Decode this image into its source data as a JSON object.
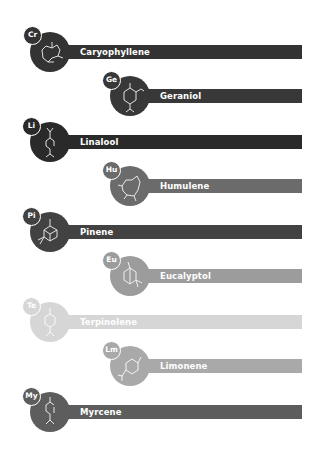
{
  "terpenes": [
    {
      "symbol": "Cr",
      "name": "Caryophyllene",
      "color": "#333333",
      "indent": "left",
      "icon": "caryophyllene-molecule-icon"
    },
    {
      "symbol": "Ge",
      "name": "Geraniol",
      "color": "#383838",
      "indent": "right",
      "icon": "geraniol-molecule-icon"
    },
    {
      "symbol": "Li",
      "name": "Linalool",
      "color": "#2a2a2a",
      "indent": "left",
      "icon": "linalool-molecule-icon"
    },
    {
      "symbol": "Hu",
      "name": "Humulene",
      "color": "#6b6b6b",
      "indent": "right",
      "icon": "humulene-molecule-icon"
    },
    {
      "symbol": "Pi",
      "name": "Pinene",
      "color": "#424242",
      "indent": "left",
      "icon": "pinene-molecule-icon"
    },
    {
      "symbol": "Eu",
      "name": "Eucalyptol",
      "color": "#9c9c9c",
      "indent": "right",
      "icon": "eucalyptol-molecule-icon"
    },
    {
      "symbol": "Te",
      "name": "Terpinolene",
      "color": "#d6d6d6",
      "indent": "left",
      "icon": "terpinolene-molecule-icon"
    },
    {
      "symbol": "Lm",
      "name": "Limonene",
      "color": "#a9a9a9",
      "indent": "right",
      "icon": "limonene-molecule-icon"
    },
    {
      "symbol": "My",
      "name": "Myrcene",
      "color": "#5d5d5d",
      "indent": "left",
      "icon": "myrcene-molecule-icon"
    }
  ]
}
